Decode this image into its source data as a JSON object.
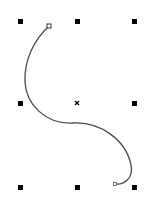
{
  "canvas": {
    "width": 157,
    "height": 206,
    "background": "#ffffff"
  },
  "selection": {
    "handle_color": "#000000",
    "handle_size": 5,
    "handles": [
      {
        "name": "top-left",
        "x": 20,
        "y": 21
      },
      {
        "name": "top-center",
        "x": 77,
        "y": 21
      },
      {
        "name": "top-right",
        "x": 134,
        "y": 21
      },
      {
        "name": "middle-left",
        "x": 20,
        "y": 103
      },
      {
        "name": "middle-right",
        "x": 134,
        "y": 103
      },
      {
        "name": "bottom-left",
        "x": 20,
        "y": 187
      },
      {
        "name": "bottom-center",
        "x": 77,
        "y": 187
      },
      {
        "name": "bottom-right",
        "x": 134,
        "y": 187
      }
    ],
    "center": {
      "x": 77,
      "y": 103
    }
  },
  "curve": {
    "stroke": "#4a4a4a",
    "stroke_width": 1.3,
    "path": "M49,26 C34,40 24,60 25,82 C26,104 45,124 72,123 C100,121 126,140 131,165 C134,178 124,185 115,184",
    "start_node": {
      "x": 49,
      "y": 26
    },
    "end_node": {
      "x": 115,
      "y": 184
    }
  }
}
